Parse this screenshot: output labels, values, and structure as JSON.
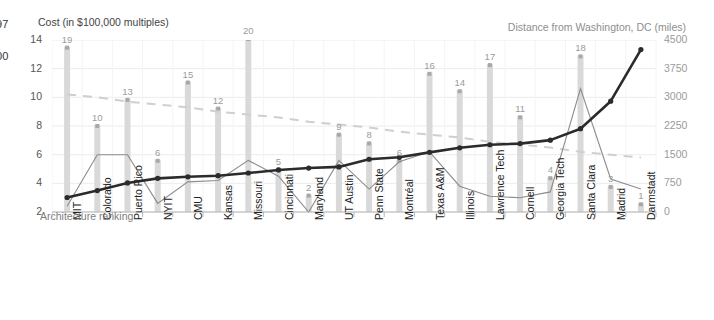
{
  "clipped_text": {
    "line1": "97",
    "line2": "00"
  },
  "axes": {
    "left_title": "Cost (in $100,000 multiples)",
    "right_title": "Distance from Washington, DC (miles)",
    "left_ticks": [
      "14",
      "12",
      "10",
      "8",
      "6",
      "4",
      "2"
    ],
    "right_ticks": [
      "4500",
      "3750",
      "3000",
      "2250",
      "1500",
      "750",
      "0"
    ]
  },
  "series_annotation": "Architecture ranking",
  "colors": {
    "bar": "#d9d9d9",
    "cost_line": "#8c8c8c",
    "distance_line": "#2b2b2b",
    "trend_line": "#cfcfcf",
    "grid": "#ececec",
    "axis": "#b5b5b5",
    "data_label": "#9b9b9b"
  },
  "chart_data": {
    "type": "bar",
    "title": "",
    "xlabel": "",
    "ylabel": "Cost (in $100,000 multiples)",
    "y2label": "Distance from Washington, DC (miles)",
    "ylim": [
      2,
      14
    ],
    "y2lim": [
      0,
      4500
    ],
    "grid": true,
    "legend": "none",
    "categories": [
      "MIT",
      "Colorado",
      "Puerto Rico",
      "NYIT",
      "CMU",
      "Kansas",
      "Missouri",
      "Cincinnati",
      "Maryland",
      "UT Austin",
      "Penn State",
      "Montréal",
      "Texas A&M",
      "Illinois",
      "Lawrence Tech",
      "Cornell",
      "Georgia Tech",
      "Santa Clara",
      "Madrid",
      "Darmstadt"
    ],
    "series": [
      {
        "name": "Architecture ranking",
        "type": "bar",
        "axis": "left",
        "labels": [
          "19",
          "10",
          "13",
          "6",
          "15",
          "12",
          "20",
          "5",
          "2",
          "9",
          "8",
          "6",
          "16",
          "14",
          "17",
          "11",
          "4",
          "18",
          "3",
          "1"
        ],
        "values": [
          19,
          10,
          13,
          6,
          15,
          12,
          20,
          5,
          2,
          9,
          8,
          6,
          16,
          14,
          17,
          11,
          4,
          18,
          3,
          1
        ]
      },
      {
        "name": "Cost",
        "type": "line",
        "axis": "left",
        "values": [
          2.4,
          6.0,
          6.0,
          2.6,
          4.1,
          4.2,
          5.6,
          4.5,
          2.0,
          5.6,
          3.6,
          5.5,
          6.2,
          3.8,
          3.1,
          3.0,
          3.4,
          10.6,
          4.3,
          3.6
        ]
      },
      {
        "name": "Distance from Washington, DC",
        "type": "line",
        "axis": "right",
        "values": [
          380,
          560,
          760,
          880,
          920,
          950,
          1020,
          1100,
          1150,
          1180,
          1380,
          1430,
          1560,
          1680,
          1760,
          1790,
          1880,
          2180,
          2900,
          4250
        ]
      },
      {
        "name": "Trend",
        "type": "line",
        "axis": "left",
        "dashed": true,
        "values": [
          10.2,
          10.0,
          9.7,
          9.5,
          9.3,
          9.0,
          8.8,
          8.6,
          8.3,
          8.1,
          7.9,
          7.6,
          7.4,
          7.2,
          6.9,
          6.7,
          6.5,
          6.2,
          6.0,
          5.8
        ]
      }
    ]
  }
}
